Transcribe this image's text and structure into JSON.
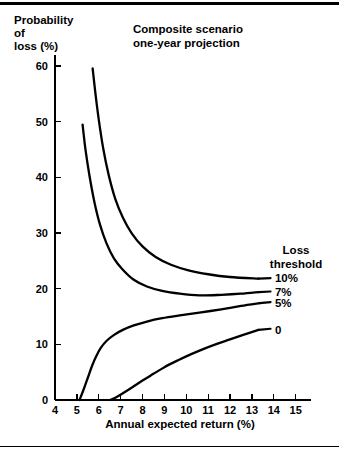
{
  "chart_data": {
    "type": "line",
    "title": "Composite scenario one-year projection",
    "title_line1": "Composite scenario",
    "title_line2": "one-year projection",
    "xlabel": "Annual expected return (%)",
    "ylabel": "Probability of loss (%)",
    "ylabel_line1": "Probability",
    "ylabel_line2": "of",
    "ylabel_line3": "loss (%)",
    "xlim": [
      4,
      15.7
    ],
    "ylim": [
      0,
      62
    ],
    "xticks": [
      4,
      5,
      6,
      7,
      8,
      9,
      10,
      11,
      12,
      13,
      14,
      15
    ],
    "xticklabels": [
      "4",
      "5",
      "6",
      "7",
      "8",
      "9",
      "10",
      "11",
      "12",
      "13",
      "14",
      "15"
    ],
    "yticks": [
      0,
      10,
      20,
      30,
      40,
      50,
      60
    ],
    "yticklabels": [
      "0",
      "10",
      "20",
      "30",
      "40",
      "50",
      "60"
    ],
    "grid": false,
    "legend_position": "right-inside",
    "legend_title_line1": "Loss",
    "legend_title_line2": "threshold",
    "series": [
      {
        "name": "10%",
        "label": "10%",
        "label_x": 14.05,
        "label_y": 22.0,
        "points": [
          [
            5.72,
            59.6
          ],
          [
            5.85,
            55.0
          ],
          [
            6.0,
            50.4
          ],
          [
            6.2,
            45.3
          ],
          [
            6.45,
            40.5
          ],
          [
            6.75,
            36.2
          ],
          [
            7.1,
            32.8
          ],
          [
            7.5,
            30.0
          ],
          [
            8.0,
            27.6
          ],
          [
            8.6,
            25.7
          ],
          [
            9.3,
            24.3
          ],
          [
            10.1,
            23.3
          ],
          [
            11.0,
            22.6
          ],
          [
            12.0,
            22.1
          ],
          [
            13.3,
            21.8
          ]
        ]
      },
      {
        "name": "7%",
        "label": "7%",
        "label_x": 14.05,
        "label_y": 19.4,
        "points": [
          [
            5.26,
            49.5
          ],
          [
            5.4,
            44.8
          ],
          [
            5.58,
            40.2
          ],
          [
            5.8,
            35.6
          ],
          [
            6.05,
            31.6
          ],
          [
            6.35,
            28.2
          ],
          [
            6.7,
            25.4
          ],
          [
            7.1,
            23.4
          ],
          [
            7.6,
            21.6
          ],
          [
            8.2,
            20.4
          ],
          [
            8.9,
            19.6
          ],
          [
            9.7,
            19.1
          ],
          [
            10.6,
            18.8
          ],
          [
            11.6,
            18.9
          ],
          [
            12.5,
            19.1
          ],
          [
            13.3,
            19.4
          ]
        ]
      },
      {
        "name": "5%",
        "label": "5%",
        "label_x": 14.05,
        "label_y": 17.4,
        "points": [
          [
            5.12,
            0.0
          ],
          [
            5.3,
            1.8
          ],
          [
            5.5,
            4.0
          ],
          [
            5.7,
            6.2
          ],
          [
            5.9,
            8.0
          ],
          [
            6.1,
            9.4
          ],
          [
            6.35,
            10.6
          ],
          [
            6.7,
            11.7
          ],
          [
            7.1,
            12.6
          ],
          [
            7.6,
            13.4
          ],
          [
            8.2,
            14.1
          ],
          [
            8.9,
            14.7
          ],
          [
            9.7,
            15.2
          ],
          [
            10.6,
            15.7
          ],
          [
            11.6,
            16.3
          ],
          [
            12.5,
            16.9
          ],
          [
            13.35,
            17.4
          ]
        ]
      },
      {
        "name": "0",
        "label": "0",
        "label_x": 14.05,
        "label_y": 12.6,
        "points": [
          [
            6.52,
            0.0
          ],
          [
            6.8,
            0.5
          ],
          [
            7.1,
            1.2
          ],
          [
            7.5,
            2.2
          ],
          [
            8.0,
            3.5
          ],
          [
            8.5,
            4.7
          ],
          [
            9.0,
            5.9
          ],
          [
            9.6,
            7.1
          ],
          [
            10.2,
            8.2
          ],
          [
            10.8,
            9.2
          ],
          [
            11.4,
            10.1
          ],
          [
            12.0,
            10.9
          ],
          [
            12.6,
            11.7
          ],
          [
            13.3,
            12.6
          ]
        ]
      }
    ],
    "leaders": [
      {
        "name": "10%",
        "x1": 13.3,
        "y1": 21.8,
        "x2": 13.85,
        "y2": 21.9
      },
      {
        "name": "7%",
        "x1": 13.3,
        "y1": 19.4,
        "x2": 13.85,
        "y2": 19.5
      },
      {
        "name": "5%",
        "x1": 13.35,
        "y1": 17.4,
        "x2": 13.85,
        "y2": 17.6
      },
      {
        "name": "0",
        "x1": 13.3,
        "y1": 12.6,
        "x2": 13.85,
        "y2": 12.8
      }
    ]
  }
}
